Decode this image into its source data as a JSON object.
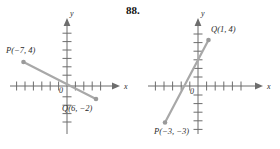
{
  "exercise": {
    "number": "88."
  },
  "colors": {
    "axis": "#6d6d6d",
    "segment": "#a8a8a8",
    "point": "#9a9a9a",
    "text": "#2b2b2b"
  },
  "graphs": [
    {
      "id": "left",
      "axis_labels": {
        "x": "x",
        "y": "y",
        "origin": "0"
      },
      "x_axis": {
        "min": -8,
        "max": 8,
        "tick_step": 1
      },
      "y_axis": {
        "min": -6,
        "max": 6,
        "tick_step": 1
      },
      "points": [
        {
          "name": "P",
          "label": "P(−7, 4)",
          "x": -7,
          "y": 4
        },
        {
          "name": "Q",
          "label": "Q(6, −2)",
          "x": 6,
          "y": -2
        }
      ],
      "segment": {
        "from": "P",
        "to": "Q"
      }
    },
    {
      "id": "right",
      "axis_labels": {
        "x": "x",
        "y": "y",
        "origin": "0"
      },
      "x_axis": {
        "min": -6,
        "max": 6,
        "tick_step": 1
      },
      "y_axis": {
        "min": -5,
        "max": 5,
        "tick_step": 1
      },
      "points": [
        {
          "name": "Q",
          "label": "Q(1, 4)",
          "x": 1,
          "y": 4
        },
        {
          "name": "P",
          "label": "P(−3, −3)",
          "x": -3,
          "y": -3
        }
      ],
      "segment": {
        "from": "P",
        "to": "Q"
      }
    }
  ]
}
